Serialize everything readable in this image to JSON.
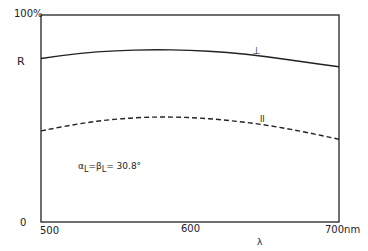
{
  "chart_data": {
    "type": "line",
    "title": "",
    "xlabel": "λ",
    "ylabel": "R",
    "xlim": [
      500,
      700
    ],
    "ylim": [
      0,
      100
    ],
    "x_ticks": [
      "500",
      "600",
      "700nm"
    ],
    "y_ticks": [
      "0",
      "100%"
    ],
    "grid": false,
    "annotation": "αL = βL = 30.8°",
    "series": [
      {
        "name": "⊥",
        "style": "solid",
        "x": [
          500,
          525,
          550,
          575,
          600,
          625,
          650,
          675,
          700
        ],
        "values": [
          79,
          81.5,
          82.8,
          83.3,
          83,
          82,
          80,
          77.5,
          75
        ]
      },
      {
        "name": "∥",
        "style": "dashed",
        "x": [
          500,
          525,
          550,
          575,
          600,
          625,
          650,
          675,
          700
        ],
        "values": [
          44,
          47.5,
          49.8,
          50.8,
          50.6,
          49.2,
          47,
          43.8,
          40
        ]
      }
    ]
  },
  "labels": {
    "y_top": "100%",
    "y_name": "R",
    "y_zero": "0",
    "x_500": "500",
    "x_600": "600",
    "x_700": "700nm",
    "x_name": "λ",
    "perp": "⊥",
    "parallel": "II",
    "annotation_alpha": "α",
    "annotation_sub1": "L",
    "annotation_eq1": "=",
    "annotation_beta": "β",
    "annotation_sub2": "L",
    "annotation_eq2": "= 30.8°"
  },
  "colors": {
    "line": "#222222",
    "background": "#ffffff"
  }
}
